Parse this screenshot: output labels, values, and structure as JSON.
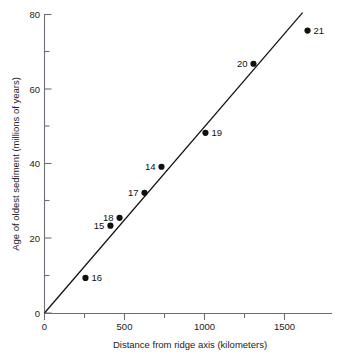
{
  "chart_data": {
    "type": "scatter",
    "title": "",
    "xlabel": "Distance from ridge axis (kilometers)",
    "ylabel": "Age of oldest sediment (millions of years)",
    "xlim": [
      0,
      1750
    ],
    "ylim": [
      0,
      80
    ],
    "grid": false,
    "legend": null,
    "x_major_ticks": [
      0,
      500,
      1000,
      1500
    ],
    "x_major_tick_labels": [
      "0",
      "500",
      "1000",
      "1500"
    ],
    "x_minor_ticks": [
      250,
      750,
      1250
    ],
    "y_major_ticks": [
      0,
      20,
      40,
      60,
      80
    ],
    "y_major_tick_labels": [
      "0",
      "20",
      "40",
      "60",
      "80"
    ],
    "y_minor_ticks": [
      10,
      30,
      50,
      70
    ],
    "point_label_key": "site",
    "points": [
      {
        "site": "16",
        "x": 256,
        "y": 9.4,
        "label_side": "right"
      },
      {
        "site": "15",
        "x": 412,
        "y": 23.4,
        "label_side": "left"
      },
      {
        "site": "18",
        "x": 469,
        "y": 25.5,
        "label_side": "left"
      },
      {
        "site": "17",
        "x": 625,
        "y": 32.2,
        "label_side": "left"
      },
      {
        "site": "14",
        "x": 731,
        "y": 39.2,
        "label_side": "left"
      },
      {
        "site": "19",
        "x": 1006,
        "y": 48.3,
        "label_side": "right"
      },
      {
        "site": "20",
        "x": 1306,
        "y": 66.8,
        "label_side": "left"
      },
      {
        "site": "21",
        "x": 1644,
        "y": 75.7,
        "label_side": "right"
      }
    ],
    "fit_line": {
      "name": "linear trend through origin",
      "x_start": 0,
      "y_start": 0,
      "x_end": 1613,
      "y_end": 80.5
    },
    "colors": {
      "marker": "#111111",
      "line": "#111111",
      "axis": "#6e6e78",
      "text": "#222222",
      "background": "#ffffff"
    }
  }
}
